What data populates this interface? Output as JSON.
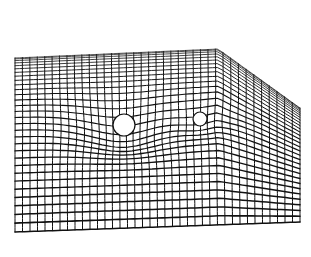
{
  "figure": {
    "description": "Perspective wireframe grid sheet warped by two spheres (spacetime curvature illustration)",
    "background": "#ffffff",
    "line_color": "#111111",
    "sheet": {
      "corners": {
        "back_left": [
          15,
          58
        ],
        "back_right": [
          218,
          49
        ],
        "side_right_top": [
          300,
          108
        ],
        "front_right": [
          300,
          222
        ],
        "front_left": [
          15,
          232
        ]
      },
      "rows": 30,
      "cols": 38
    },
    "bodies": [
      {
        "name": "large-sphere",
        "cx": 124,
        "cy": 125,
        "r": 11,
        "depth": 16,
        "radius_of_influence": 90
      },
      {
        "name": "small-sphere",
        "cx": 200,
        "cy": 119,
        "r": 7,
        "depth": 7,
        "radius_of_influence": 55
      }
    ]
  }
}
